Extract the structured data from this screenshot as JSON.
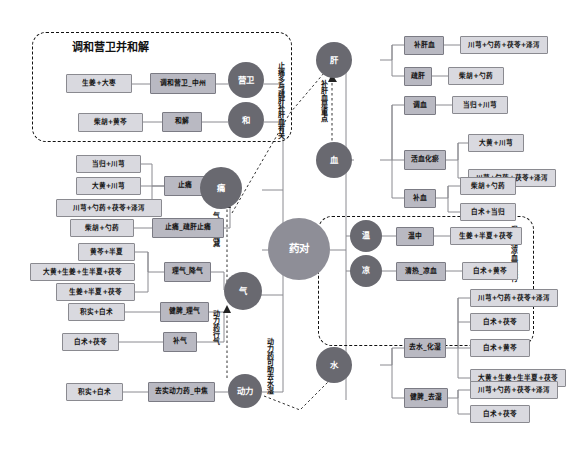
{
  "diagram": {
    "title_group_left": "调和营卫并和解",
    "center_node": "药对",
    "groups": [
      {
        "name": "left-dashed-group",
        "label": "调和营卫并和解"
      },
      {
        "name": "right-dashed-group",
        "label": "温中和凉血同进行"
      }
    ],
    "annotations": [
      {
        "name": "annotation-zhitong",
        "text": "止痛多与疏肝补肝血有关"
      },
      {
        "name": "annotation-buganxue",
        "text": "补肝血是重点"
      },
      {
        "name": "annotation-qitong",
        "text": "气通则痛减"
      },
      {
        "name": "annotation-donglixingqi",
        "text": "动力药行气"
      },
      {
        "name": "annotation-qushuishi",
        "text": "动力药可助去水湿"
      },
      {
        "name": "annotation-wenzhong",
        "text": "温中和凉血同进行"
      }
    ],
    "hubs": {
      "yingwei": "营卫",
      "he": "和",
      "tong": "痛",
      "qi": "气",
      "dongli": "动力",
      "gan": "肝",
      "xue": "血",
      "wen": "温",
      "liang": "凉",
      "shui": "水"
    },
    "left_branches": [
      {
        "hub": "营卫",
        "funcs": [
          {
            "label": "调和营卫_中州",
            "herbs": [
              "生姜+大枣"
            ]
          }
        ]
      },
      {
        "hub": "和",
        "funcs": [
          {
            "label": "和解",
            "herbs": [
              "柴胡+黄芩"
            ]
          }
        ]
      },
      {
        "hub": "痛",
        "funcs": [
          {
            "label": "止痛",
            "herbs": [
              "当归+川芎",
              "大黄+川芎",
              "川芎+勺药+茯苓+泽泻"
            ]
          },
          {
            "label": "止痛_疏肝止痛",
            "herbs": [
              "柴胡+勺药"
            ]
          }
        ]
      },
      {
        "hub": "气",
        "funcs": [
          {
            "label": "理气_降气",
            "herbs": [
              "黄芩+半夏",
              "大黄+生姜+生半夏+茯苓",
              "生姜+半夏+茯苓"
            ]
          },
          {
            "label": "健脾_理气",
            "herbs": [
              "积实+白术"
            ]
          },
          {
            "label": "补气",
            "herbs": [
              "白术+茯苓"
            ]
          }
        ]
      },
      {
        "hub": "动力",
        "funcs": [
          {
            "label": "去实动力药_中焦",
            "herbs": [
              "积实+白术"
            ]
          }
        ]
      }
    ],
    "right_branches": [
      {
        "hub": "肝",
        "funcs": [
          {
            "label": "补肝血",
            "herbs": [
              "川芎+勺药+茯苓+泽泻"
            ]
          },
          {
            "label": "疏肝",
            "herbs": [
              "柴胡+勺药"
            ]
          }
        ]
      },
      {
        "hub": "血",
        "funcs": [
          {
            "label": "调血",
            "herbs": [
              "当归+川芎"
            ]
          },
          {
            "label": "活血化瘀",
            "herbs": [
              "大黄+川芎",
              "川芎+勺药+茯苓+泽泻"
            ]
          },
          {
            "label": "补血",
            "herbs": [
              "柴胡+勺药",
              "白术+当归"
            ]
          }
        ]
      },
      {
        "hub": "温",
        "funcs": [
          {
            "label": "温中",
            "herbs": [
              "生姜+半夏+茯苓"
            ]
          }
        ]
      },
      {
        "hub": "凉",
        "funcs": [
          {
            "label": "清热_凉血",
            "herbs": [
              "白术+黄芩"
            ]
          }
        ]
      },
      {
        "hub": "水",
        "funcs": [
          {
            "label": "去水_化湿",
            "herbs": [
              "川芎+勺药+茯苓+泽泻",
              "白术+茯苓",
              "白术+黄芩",
              "大黄+生姜+生半夏+茯苓"
            ]
          },
          {
            "label": "健脾_去湿",
            "herbs": [
              "川芎+勺药+茯苓+泽泻",
              "白术+茯苓"
            ]
          }
        ]
      }
    ],
    "colors": {
      "hub": "#696970",
      "center": "#8e8e97",
      "func_box": "#b9b9c2",
      "leaf_box": "#d9d9df",
      "line": "#8a8a90",
      "dashed": "#111111"
    }
  }
}
